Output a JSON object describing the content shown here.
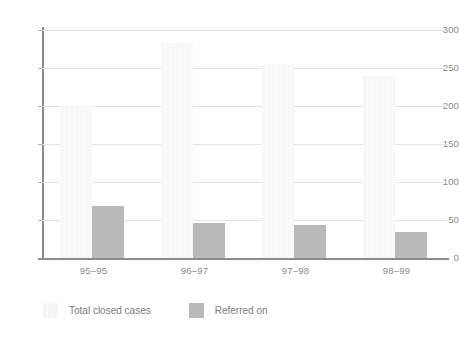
{
  "chart_data": {
    "type": "bar",
    "title": "",
    "xlabel": "",
    "ylabel": "",
    "categories": [
      "95–95",
      "96–97",
      "97–98",
      "98–99"
    ],
    "series": [
      {
        "name": "Total closed cases",
        "color": "#f7f7f7",
        "values": [
          200,
          283,
          255,
          240
        ]
      },
      {
        "name": "Referred on",
        "color": "#b9b9b9",
        "values": [
          68,
          46,
          44,
          34
        ]
      }
    ],
    "ylim": [
      0,
      300
    ],
    "yticks": [
      0,
      50,
      100,
      150,
      200,
      250,
      300
    ],
    "ytick_labels": [
      "0",
      "50",
      "100",
      "150",
      "200",
      "250",
      "300"
    ],
    "grid": true,
    "legend_position": "bottom-left"
  },
  "axis": {
    "y_labels": [
      "300",
      "250",
      "200",
      "150",
      "100",
      "50",
      "0"
    ],
    "x_labels": [
      "95–95",
      "96–97",
      "97–98",
      "98–99"
    ]
  },
  "legend": {
    "items": [
      {
        "label": "Total closed cases",
        "swatch": "series-total"
      },
      {
        "label": "Referred on",
        "swatch": "series-referred"
      }
    ]
  }
}
